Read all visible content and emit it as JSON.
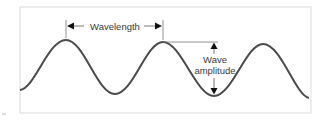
{
  "diagram": {
    "labels": {
      "wavelength": "Wavelength",
      "amplitude_line1": "Wave",
      "amplitude_line2": "amplitude"
    },
    "colors": {
      "wave": "#4a4a4a",
      "frame": "#d8d8d8",
      "text": "#3a3a3a",
      "arrow": "#111111"
    }
  }
}
